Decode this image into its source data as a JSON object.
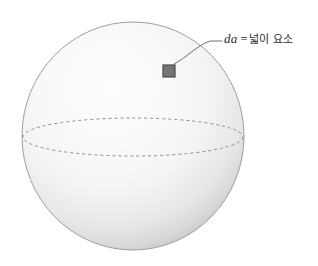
{
  "figure": {
    "type": "sphere-diagram",
    "background_color": "#ffffff",
    "sphere": {
      "name": "shaded-sphere",
      "center_x": 133,
      "center_y": 136,
      "radius_x": 111,
      "radius_y": 114,
      "fill_light": "#fbfbfb",
      "fill_mid": "#ededed",
      "fill_dark": "#b3b3b3",
      "outline_color": "#9a9a9a",
      "highlight_x": 92,
      "highlight_y": 82
    },
    "equator": {
      "name": "equator-dashed-ellipse",
      "center_x": 133,
      "center_y": 137,
      "radius_x": 110,
      "radius_y": 19,
      "stroke_color": "#8c8c8c",
      "dash_pattern": "3 3",
      "stroke_width": 1
    },
    "area_element": {
      "name": "area-element-square",
      "x": 163,
      "y": 65,
      "width": 12,
      "height": 12,
      "fill_color": "#757575",
      "stroke_color": "#4a4a4a"
    },
    "leader_line": {
      "name": "leader-line",
      "stroke_color": "#6e6e6e",
      "stroke_width": 1,
      "start_x": 174,
      "start_y": 64,
      "end_x": 222,
      "end_y": 41
    }
  },
  "annotation": {
    "symbol": "da",
    "equals": "=",
    "description": "넓이 요소",
    "full_text": "da = 넓이 요소"
  }
}
